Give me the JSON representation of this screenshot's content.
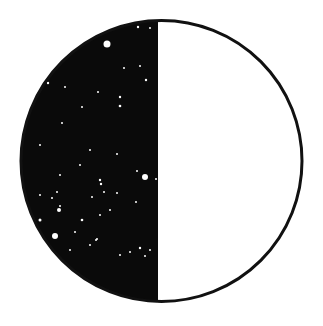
{
  "figure": {
    "shape": "half-filled-circle",
    "colors": {
      "fill_dark": "#0a0a0a",
      "fill_light": "#ffffff",
      "outline": "#111111",
      "speckle": "#ffffff",
      "background": "#ffffff"
    },
    "circle": {
      "cx": 161.5,
      "cy": 161,
      "r": 140.5,
      "stroke_width": 3
    },
    "divider_x": 158,
    "speckles": [
      [
        107,
        44,
        3.5
      ],
      [
        138,
        27,
        1.2
      ],
      [
        150,
        28,
        1
      ],
      [
        124,
        68,
        1
      ],
      [
        140,
        66,
        1
      ],
      [
        146,
        80,
        1.2
      ],
      [
        120,
        97,
        1.2
      ],
      [
        120,
        106,
        1.3
      ],
      [
        98,
        92,
        1
      ],
      [
        82,
        107,
        1
      ],
      [
        65,
        87,
        1
      ],
      [
        48,
        83,
        1.2
      ],
      [
        62,
        123,
        1
      ],
      [
        40,
        145,
        1
      ],
      [
        90,
        150,
        1
      ],
      [
        117,
        154,
        1
      ],
      [
        60,
        175,
        1
      ],
      [
        80,
        165,
        1
      ],
      [
        100,
        180,
        1.2
      ],
      [
        137,
        171,
        1
      ],
      [
        145,
        177,
        3
      ],
      [
        156,
        179,
        1
      ],
      [
        101,
        184,
        1.2
      ],
      [
        104,
        192,
        1
      ],
      [
        117,
        193,
        1
      ],
      [
        52,
        198,
        1
      ],
      [
        57,
        192,
        1
      ],
      [
        40,
        195,
        1
      ],
      [
        60,
        206,
        1
      ],
      [
        92,
        197,
        1
      ],
      [
        136,
        202,
        1
      ],
      [
        110,
        210,
        1
      ],
      [
        59,
        210,
        2
      ],
      [
        82,
        220,
        1.3
      ],
      [
        100,
        215,
        1
      ],
      [
        40,
        220,
        1.5
      ],
      [
        55,
        236,
        3
      ],
      [
        75,
        232,
        1
      ],
      [
        97,
        239,
        1
      ],
      [
        140,
        248,
        1.2
      ],
      [
        150,
        250,
        1
      ],
      [
        130,
        252,
        1
      ],
      [
        46,
        241,
        1
      ],
      [
        96,
        240,
        1
      ],
      [
        90,
        245,
        1
      ],
      [
        70,
        250,
        1
      ],
      [
        120,
        255,
        1
      ],
      [
        145,
        256,
        1
      ]
    ]
  }
}
